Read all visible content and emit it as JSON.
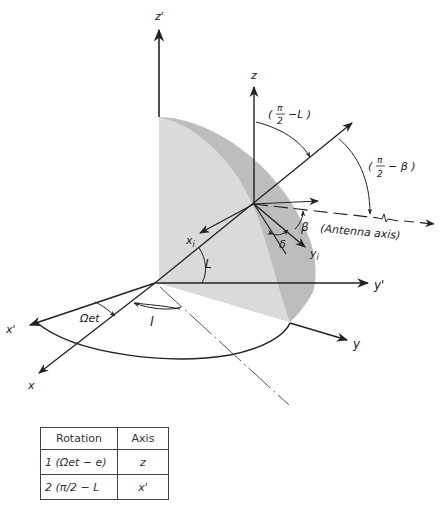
{
  "diagram": {
    "axes": {
      "z_prime": "z'",
      "z": "z",
      "y_prime": "y'",
      "y": "y",
      "x_prime": "x'",
      "x": "x",
      "x_i": "xi",
      "y_i": "yi"
    },
    "angles": {
      "pi2_minus_L": "(π/2 − L)",
      "pi2_minus_beta": "(π/2 − β)",
      "beta": "β",
      "delta": "δ",
      "L": "L",
      "l": "l",
      "omega_et": "Ωet"
    },
    "annotations": {
      "antenna_axis": "(Antenna axis)"
    },
    "colors": {
      "line": "#222222",
      "sphere_light": "#dcdcdc",
      "sphere_dark": "#bdbdbd"
    }
  },
  "table": {
    "headers": [
      "Rotation",
      "Axis"
    ],
    "rows": [
      {
        "rotation": "1 (Ωet − e)",
        "axis": "z"
      },
      {
        "rotation": "2 (π/2 − L",
        "axis": "x'"
      }
    ]
  }
}
